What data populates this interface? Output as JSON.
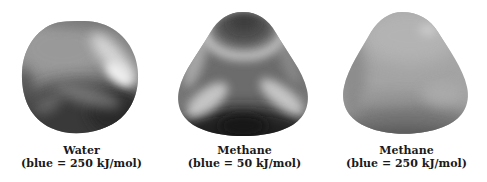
{
  "figure": {
    "background_color": "#ffffff",
    "text_color": "#1a1a1a",
    "panels": [
      {
        "molecule": "Water",
        "caption_line1": "Water",
        "caption_line2": "(blue = 250 kJ/mol)",
        "blue_scale_kj_per_mol": "250",
        "colors": {
          "base": "#858585",
          "highlight": "#ededed",
          "shadow": "#2f2f2f"
        }
      },
      {
        "molecule": "Methane",
        "caption_line1": "Methane",
        "caption_line2": "(blue = 50 kJ/mol)",
        "blue_scale_kj_per_mol": "50",
        "colors": {
          "base": "#787878",
          "highlight": "#d2d2d2",
          "shadow": "#1e1e1e"
        }
      },
      {
        "molecule": "Methane",
        "caption_line1": "Methane",
        "caption_line2": "(blue = 250 kJ/mol)",
        "blue_scale_kj_per_mol": "250",
        "colors": {
          "base": "#a4a4a4",
          "highlight": "#cacaca",
          "shadow": "#6e6e6e"
        }
      }
    ]
  }
}
